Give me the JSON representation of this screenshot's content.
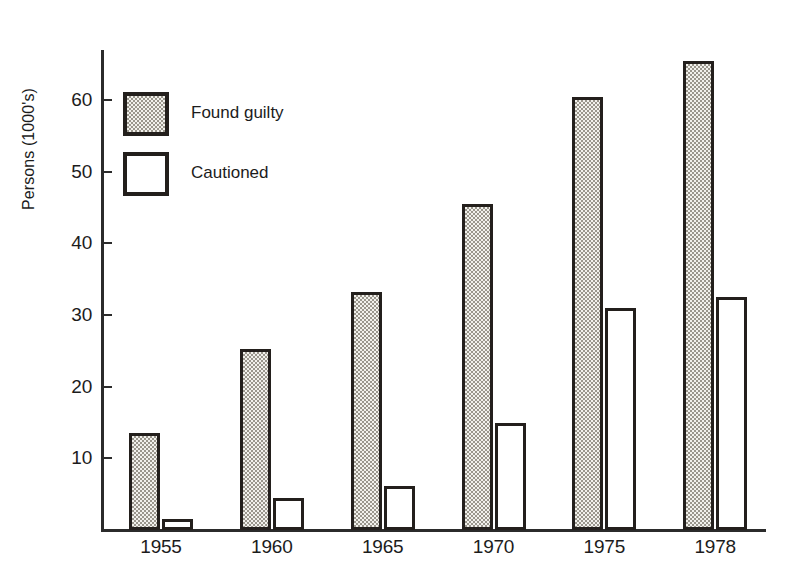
{
  "chart_data": {
    "type": "bar",
    "title": "",
    "xlabel": "",
    "ylabel": "Persons (1000's)",
    "categories": [
      "1955",
      "1960",
      "1965",
      "1970",
      "1975",
      "1978"
    ],
    "series": [
      {
        "name": "Found guilty",
        "fill": "stipple",
        "values": [
          13.5,
          25.3,
          33.2,
          45.5,
          60.5,
          65.5
        ]
      },
      {
        "name": "Cautioned",
        "fill": "white",
        "values": [
          1.5,
          4.5,
          6.2,
          15.0,
          31.0,
          32.5
        ]
      }
    ],
    "ylim": [
      0,
      67
    ],
    "yticks": [
      10,
      20,
      30,
      40,
      50,
      60
    ],
    "ytick_labels": [
      "10",
      "20",
      "30",
      "40",
      "50",
      "60"
    ],
    "grid": false,
    "legend_position": "upper-left-inside"
  },
  "axes": {
    "y_title": "Persons (1000's)",
    "tick_color": "#2b2b2b"
  },
  "legend": {
    "items": [
      {
        "label": "Found guilty",
        "swatch": "stipple-gray"
      },
      {
        "label": "Cautioned",
        "swatch": "white"
      }
    ]
  },
  "colors": {
    "ink": "#231f1c",
    "stipple_light": "#f2f1ec",
    "stipple_dark": "#9a968c",
    "paper": "#ffffff"
  }
}
